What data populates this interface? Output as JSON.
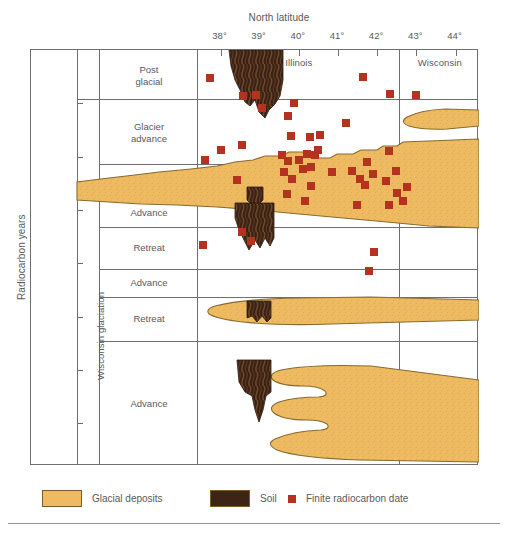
{
  "chart_data": {
    "type": "scatter",
    "title": "",
    "xlabel": "North latitude",
    "ylabel": "Radiocarbon years",
    "xtick_labels": [
      "38°",
      "39°",
      "40°",
      "41°",
      "42°",
      "43°",
      "44°"
    ],
    "xtick_values": [
      38,
      39,
      40,
      41,
      42,
      43,
      44
    ],
    "xlim": [
      37.4,
      44.6
    ],
    "ytick_labels": [
      "10,000",
      "20,000",
      "30,000",
      "40,000",
      "50,000",
      "60,000",
      "70,000"
    ],
    "ytick_values": [
      10000,
      20000,
      30000,
      40000,
      50000,
      60000,
      70000
    ],
    "ylim": [
      0,
      78000
    ],
    "grid": false,
    "legend_position": "below-axes",
    "legend": [
      {
        "label": "Glacial deposits",
        "swatch": "glacial-deposits-swatch",
        "color": "#eeba62"
      },
      {
        "label": "Soil",
        "swatch": "soil-swatch",
        "color": "#3d2416"
      },
      {
        "label": "Finite radiocarbon date",
        "swatch": "radiocarbon-date-swatch",
        "color": "#b4331f"
      }
    ],
    "region_labels": [
      {
        "label": "Illinois",
        "latitude": 40.0,
        "years": 2400
      },
      {
        "label": "Wisconsin",
        "latitude": 43.6,
        "years": 2400
      }
    ],
    "stratigraphic_units": [
      {
        "label": "Post\nglacial",
        "top_years": 0,
        "bottom_years": 9200
      },
      {
        "label": "Glacier\nadvance",
        "top_years": 9200,
        "bottom_years": 21400
      },
      {
        "label": "Retreat",
        "top_years": 21400,
        "bottom_years": 28000
      },
      {
        "label": "Advance",
        "top_years": 28000,
        "bottom_years": 33200
      },
      {
        "label": "Retreat",
        "top_years": 33200,
        "bottom_years": 41000
      },
      {
        "label": "Advance",
        "top_years": 41000,
        "bottom_years": 46400
      },
      {
        "label": "Retreat",
        "top_years": 46400,
        "bottom_years": 54600
      },
      {
        "label": "Advance",
        "top_years": 54600,
        "bottom_years": 78000
      }
    ],
    "supergroup_label": "Wisconsin glaciation",
    "series": [
      {
        "name": "Finite radiocarbon date",
        "marker": "square",
        "color": "#b4331f",
        "points": [
          {
            "latitude": 37.72,
            "years": 5200
          },
          {
            "latitude": 38.58,
            "years": 8600
          },
          {
            "latitude": 38.9,
            "years": 8500
          },
          {
            "latitude": 39.05,
            "years": 10900
          },
          {
            "latitude": 39.88,
            "years": 9900
          },
          {
            "latitude": 39.72,
            "years": 12400
          },
          {
            "latitude": 41.63,
            "years": 5100
          },
          {
            "latitude": 42.33,
            "years": 8300
          },
          {
            "latitude": 43.0,
            "years": 8400
          },
          {
            "latitude": 41.2,
            "years": 13600
          },
          {
            "latitude": 40.53,
            "years": 15900
          },
          {
            "latitude": 39.8,
            "years": 16200
          },
          {
            "latitude": 40.28,
            "years": 16300
          },
          {
            "latitude": 38.55,
            "years": 17900
          },
          {
            "latitude": 38.0,
            "years": 18700
          },
          {
            "latitude": 40.48,
            "years": 18700
          },
          {
            "latitude": 42.3,
            "years": 19000
          },
          {
            "latitude": 39.57,
            "years": 19700
          },
          {
            "latitude": 40.2,
            "years": 19500
          },
          {
            "latitude": 40.42,
            "years": 19600
          },
          {
            "latitude": 37.6,
            "years": 20700
          },
          {
            "latitude": 39.72,
            "years": 20900
          },
          {
            "latitude": 40.0,
            "years": 20700
          },
          {
            "latitude": 41.75,
            "years": 21000
          },
          {
            "latitude": 40.32,
            "years": 21900
          },
          {
            "latitude": 39.62,
            "years": 22900
          },
          {
            "latitude": 40.1,
            "years": 22400
          },
          {
            "latitude": 40.85,
            "years": 22800
          },
          {
            "latitude": 41.35,
            "years": 22600
          },
          {
            "latitude": 42.48,
            "years": 22700
          },
          {
            "latitude": 41.9,
            "years": 23200
          },
          {
            "latitude": 38.42,
            "years": 24300
          },
          {
            "latitude": 39.82,
            "years": 24200
          },
          {
            "latitude": 41.55,
            "years": 24100
          },
          {
            "latitude": 42.23,
            "years": 24600
          },
          {
            "latitude": 40.3,
            "years": 25500
          },
          {
            "latitude": 41.68,
            "years": 25300
          },
          {
            "latitude": 42.75,
            "years": 25700
          },
          {
            "latitude": 39.7,
            "years": 27000
          },
          {
            "latitude": 42.5,
            "years": 26800
          },
          {
            "latitude": 40.15,
            "years": 28400
          },
          {
            "latitude": 41.48,
            "years": 29100
          },
          {
            "latitude": 42.3,
            "years": 29000
          },
          {
            "latitude": 42.65,
            "years": 28400
          },
          {
            "latitude": 38.55,
            "years": 34200
          },
          {
            "latitude": 38.78,
            "years": 35800
          },
          {
            "latitude": 37.55,
            "years": 36600
          },
          {
            "latitude": 41.93,
            "years": 37800
          },
          {
            "latitude": 41.8,
            "years": 41400
          }
        ]
      }
    ],
    "glacial_deposit_bodies": 4,
    "soil_bodies": 4
  },
  "legend_panel": {
    "items": [
      {
        "name": "glacial-deposits",
        "label": "Glacial deposits"
      },
      {
        "name": "soil",
        "label": "Soil"
      },
      {
        "name": "finite-radiocarbon-date",
        "label": "Finite radiocarbon date"
      }
    ]
  },
  "colors": {
    "glacial": "#eeba62",
    "glacial_edge": "#8a6a2c",
    "soil": "#3d2416",
    "soil_light": "#6b4a2e",
    "date": "#b4331f",
    "frame": "#6d6e71",
    "text": "#58595b"
  }
}
